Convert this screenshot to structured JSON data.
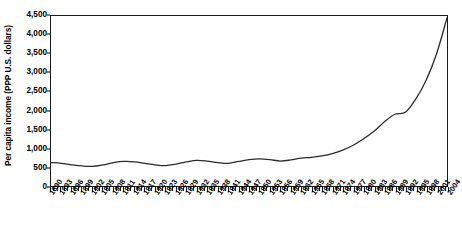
{
  "chart_data": {
    "type": "line",
    "title": "",
    "subtitle": "",
    "xlabel": "",
    "ylabel": "Per capita income (PPP U.S. dollars)",
    "xlim": [
      1890,
      2004
    ],
    "ylim": [
      0,
      4500
    ],
    "grid": false,
    "legend": false,
    "legend_position": "none",
    "y_ticks": [
      0,
      500,
      1000,
      1500,
      2000,
      2500,
      3000,
      3500,
      4000,
      4500
    ],
    "y_tick_labels": [
      "0",
      "500",
      "1,000",
      "1,500",
      "2,000",
      "2,500",
      "3,000",
      "3,500",
      "4,000",
      "4,500"
    ],
    "x_tick_labels": [
      "1890",
      "1893",
      "1896",
      "1899",
      "1902",
      "1905",
      "1908",
      "1911",
      "1914",
      "1917",
      "1920",
      "1923",
      "1926",
      "1929",
      "1932",
      "1935",
      "1938",
      "1941",
      "1944",
      "1947",
      "1950",
      "1953",
      "1956",
      "1959",
      "1962",
      "1965",
      "1968",
      "1971",
      "1974",
      "1977",
      "1980",
      "1983",
      "1986",
      "1989",
      "1992",
      "1995",
      "1998",
      "2001",
      "2004"
    ],
    "x_tick_interval_years": 3,
    "minor_tick_interval_years": 1,
    "series": [
      {
        "name": "Per capita income",
        "color": "#2b2b2b",
        "x": [
          1890,
          1893,
          1896,
          1899,
          1902,
          1905,
          1908,
          1911,
          1914,
          1917,
          1920,
          1923,
          1926,
          1929,
          1932,
          1935,
          1938,
          1941,
          1944,
          1947,
          1950,
          1953,
          1956,
          1959,
          1962,
          1965,
          1968,
          1971,
          1974,
          1977,
          1980,
          1983,
          1986,
          1989,
          1992,
          1995,
          1998,
          2001,
          2004
        ],
        "values": [
          620,
          600,
          560,
          530,
          520,
          560,
          620,
          650,
          640,
          600,
          560,
          540,
          580,
          640,
          680,
          660,
          620,
          600,
          650,
          700,
          720,
          700,
          660,
          690,
          740,
          760,
          800,
          860,
          950,
          1080,
          1250,
          1450,
          1700,
          1900,
          1950,
          2300,
          2800,
          3500,
          4450
        ]
      }
    ],
    "annotations": {
      "plateau_note": "Growth pauses near 1,900-2,000 around 1989-1992",
      "early_range_note": "Values oscillate between roughly 520 and 760 before 1970"
    }
  }
}
